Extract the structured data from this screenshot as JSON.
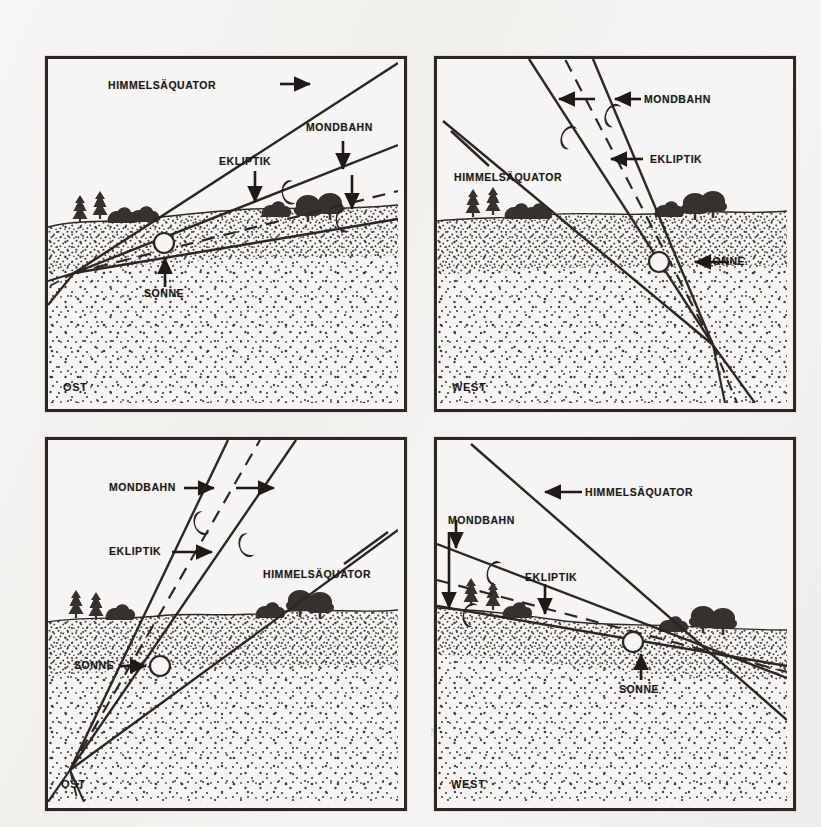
{
  "figure": {
    "type": "four-panel line diagram"
  },
  "labels": {
    "himmelsaequator": "HIMMELSÄQUATOR",
    "mondbahn": "MONDBAHN",
    "ekliptik": "EKLIPTIK",
    "sonne": "SONNE",
    "ost": "OST",
    "west": "WEST"
  },
  "panels": [
    {
      "id": "top-left",
      "horizon": "OST",
      "corner_label": "OST",
      "annotations": [
        {
          "name": "himmelsaequator",
          "text": "HIMMELSÄQUATOR",
          "arrow": "right"
        },
        {
          "name": "mondbahn",
          "text": "MONDBAHN",
          "arrow": "down"
        },
        {
          "name": "ekliptik",
          "text": "EKLIPTIK",
          "arrow": "down"
        },
        {
          "name": "sonne",
          "text": "SONNE",
          "arrow": "up"
        }
      ],
      "moons": 2,
      "sun": 1
    },
    {
      "id": "top-right",
      "horizon": "WEST",
      "corner_label": "WEST",
      "annotations": [
        {
          "name": "mondbahn",
          "text": "MONDBAHN",
          "arrow": "left"
        },
        {
          "name": "ekliptik",
          "text": "EKLIPTIK",
          "arrow": "left"
        },
        {
          "name": "himmelsaequator",
          "text": "HIMMELSÄQUATOR",
          "arrow": "none"
        },
        {
          "name": "sonne",
          "text": "SONNE",
          "arrow": "left"
        }
      ],
      "moons": 2,
      "sun": 1
    },
    {
      "id": "bottom-left",
      "horizon": "OST",
      "corner_label": "OST",
      "annotations": [
        {
          "name": "mondbahn",
          "text": "MONDBAHN",
          "arrow": "right"
        },
        {
          "name": "ekliptik",
          "text": "EKLIPTIK",
          "arrow": "right"
        },
        {
          "name": "himmelsaequator",
          "text": "HIMMELSÄQUATOR",
          "arrow": "none"
        },
        {
          "name": "sonne",
          "text": "SONNE",
          "arrow": "right"
        }
      ],
      "moons": 2,
      "sun": 1
    },
    {
      "id": "bottom-right",
      "horizon": "WEST",
      "corner_label": "WEST",
      "annotations": [
        {
          "name": "himmelsaequator",
          "text": "HIMMELSÄQUATOR",
          "arrow": "left"
        },
        {
          "name": "mondbahn",
          "text": "MONDBAHN",
          "arrow": "down"
        },
        {
          "name": "ekliptik",
          "text": "EKLIPTIK",
          "arrow": "down"
        },
        {
          "name": "sonne",
          "text": "SONNE",
          "arrow": "up"
        }
      ],
      "moons": 2,
      "sun": 1
    }
  ],
  "bleed_through_text": [
    "der Erde. Die",
    "Mond in der Nähe",
    "des Punktes",
    "bei 90° und 270°",
    "abnehmen"
  ],
  "colors": {
    "ink": "#2a2724",
    "paper": "#f4f3f1",
    "ground_stipple": "#4a4540"
  }
}
